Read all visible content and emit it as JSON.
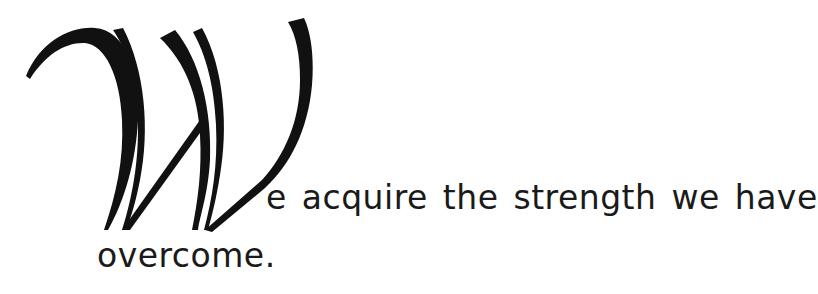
{
  "quote": {
    "dropcap_letter": "W",
    "line1": "e acquire the strength we have",
    "line2": "overcome.",
    "full_text": "We acquire the strength we have overcome."
  },
  "colors": {
    "ink": "#111111",
    "background": "#ffffff"
  }
}
